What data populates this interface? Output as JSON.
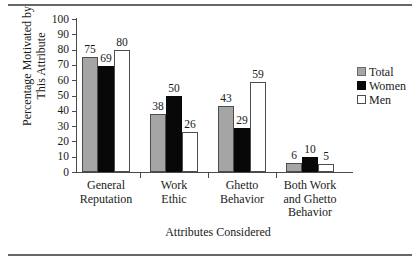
{
  "chart_data": {
    "type": "bar",
    "title": "",
    "xlabel": "Attributes Considered",
    "ylabel": "Percentage Motivated by\nThis Attribute",
    "ylim": [
      0,
      100
    ],
    "yticks": [
      0,
      10,
      20,
      30,
      40,
      50,
      60,
      70,
      80,
      90,
      100
    ],
    "grid": false,
    "legend_position": "right",
    "categories": [
      "General\nReputation",
      "Work\nEthic",
      "Ghetto\nBehavior",
      "Both Work\nand Ghetto\nBehavior"
    ],
    "series": [
      {
        "name": "Total",
        "color": "#a5a5a5",
        "values": [
          75,
          38,
          43,
          6
        ]
      },
      {
        "name": "Women",
        "color": "#080808",
        "values": [
          69,
          50,
          29,
          10
        ]
      },
      {
        "name": "Men",
        "color": "#ffffff",
        "values": [
          80,
          26,
          59,
          5
        ]
      }
    ],
    "value_labels": [
      [
        "75",
        "69",
        "80"
      ],
      [
        "38",
        "50",
        "26"
      ],
      [
        "43",
        "29",
        "59"
      ],
      [
        "6",
        "10",
        "5"
      ]
    ]
  }
}
